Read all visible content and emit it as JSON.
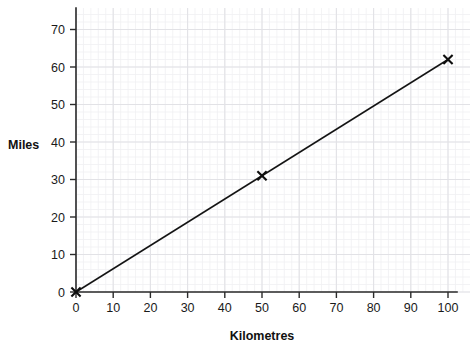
{
  "chart_data": {
    "type": "line",
    "title": "",
    "xlabel": "Kilometres",
    "ylabel": "Miles",
    "xlim": [
      0,
      100
    ],
    "ylim": [
      0,
      72
    ],
    "xticks": [
      0,
      10,
      20,
      30,
      40,
      50,
      60,
      70,
      80,
      90,
      100
    ],
    "xtick_labels": [
      "0",
      "10",
      "20",
      "30",
      "40",
      "50",
      "60",
      "70",
      "80",
      "90",
      "100"
    ],
    "yticks": [
      0,
      10,
      20,
      30,
      40,
      50,
      60,
      70
    ],
    "ytick_labels": [
      "0",
      "10",
      "20",
      "30",
      "40",
      "50",
      "60",
      "70"
    ],
    "grid": true,
    "grid_minor_divisions": 5,
    "legend": null,
    "series": [
      {
        "name": "km-to-miles-conversion",
        "marker": "x",
        "color": "#141414",
        "points": [
          {
            "x": 0,
            "y": 0
          },
          {
            "x": 50,
            "y": 31
          },
          {
            "x": 100,
            "y": 62
          }
        ],
        "marked_points": [
          {
            "x": 0,
            "y": 0
          },
          {
            "x": 50,
            "y": 31
          },
          {
            "x": 100,
            "y": 62
          }
        ]
      }
    ]
  },
  "axes": {
    "y_title": "Miles",
    "x_title": "Kilometres"
  }
}
